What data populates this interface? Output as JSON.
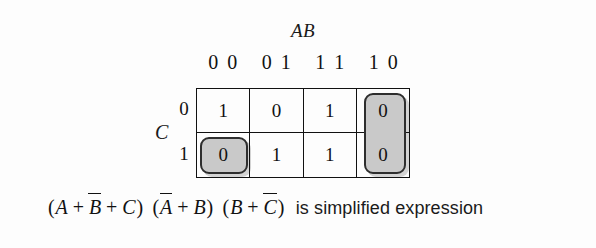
{
  "diagram": {
    "type": "karnaugh-map",
    "column_variable_label": "AB",
    "row_variable_label": "C",
    "column_headers": [
      {
        "bits": [
          "0",
          "0"
        ]
      },
      {
        "bits": [
          "0",
          "1"
        ]
      },
      {
        "bits": [
          "1",
          "1"
        ]
      },
      {
        "bits": [
          "1",
          "0"
        ]
      }
    ],
    "row_headers": [
      "0",
      "1"
    ],
    "rows": [
      {
        "label": "0",
        "cells": [
          "1",
          "0",
          "1",
          "0"
        ]
      },
      {
        "label": "1",
        "cells": [
          "0",
          "1",
          "1",
          "0"
        ]
      }
    ],
    "groups": [
      {
        "name": "group-bottom-left",
        "cells": "AB=00,C=1",
        "fill": "#c9c9c9"
      },
      {
        "name": "group-right-column",
        "cells": "AB=10,C=0 and AB=10,C=1",
        "fill": "#c9c9c9"
      }
    ]
  },
  "expression": {
    "terms": [
      {
        "open": "(",
        "items": [
          {
            "text": "A",
            "bar": false
          },
          {
            "op": "+"
          },
          {
            "text": "B",
            "bar": true
          },
          {
            "op": "+"
          },
          {
            "text": "C",
            "bar": false
          }
        ],
        "close": ")"
      },
      {
        "open": "(",
        "items": [
          {
            "text": "A",
            "bar": true
          },
          {
            "op": "+"
          },
          {
            "text": "B",
            "bar": false
          }
        ],
        "close": ")"
      },
      {
        "open": "(",
        "items": [
          {
            "text": "B",
            "bar": false
          },
          {
            "op": "+"
          },
          {
            "text": "C",
            "bar": true
          }
        ],
        "close": ")"
      }
    ],
    "caption": "is simplified expression"
  },
  "colors": {
    "background": "#fdfdfd",
    "ink": "#111111",
    "group_fill": "#c9c9c9",
    "group_border": "#2e2e2e"
  }
}
